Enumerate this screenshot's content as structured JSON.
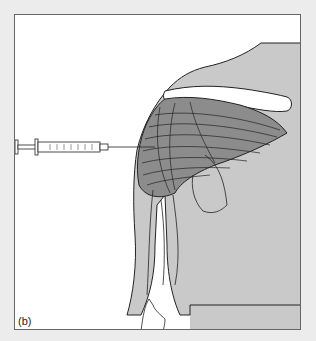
{
  "figure": {
    "panel_label": "(b)",
    "elements": [
      "syringe",
      "shoulder",
      "deltoid-muscle",
      "clavicle",
      "humerus",
      "torso"
    ],
    "colors": {
      "background": "#ececec",
      "panel": "#ffffff",
      "skin": "#c9c9c9",
      "muscle": "#8c8c8c",
      "outline": "#222222"
    }
  }
}
